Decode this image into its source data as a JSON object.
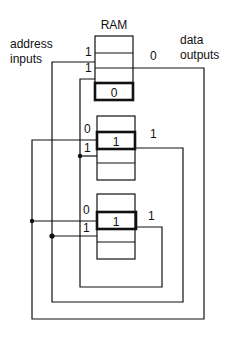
{
  "title": "RAM",
  "labels": {
    "address_line1": "address",
    "address_line2": "inputs",
    "data_line1": "data",
    "data_line2": "outputs"
  },
  "rams": [
    {
      "addr_bits": [
        "1",
        "1"
      ],
      "selected_value": "0",
      "output_bit": "0"
    },
    {
      "addr_bits": [
        "0",
        "1"
      ],
      "selected_value": "1",
      "output_bit": "1"
    },
    {
      "addr_bits": [
        "0",
        "1"
      ],
      "selected_value": "1",
      "output_bit": "1"
    }
  ]
}
